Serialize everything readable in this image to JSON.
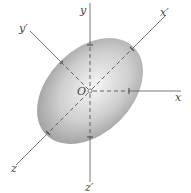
{
  "figure": {
    "origin": {
      "label": "O",
      "x": 90,
      "y": 91
    },
    "ellipsoid": {
      "cx": 90,
      "cy": 91,
      "rx": 42,
      "ry": 62,
      "rotation_deg": 45,
      "fill_center": "#f4f4f4",
      "fill_edge": "#9a9a9a"
    },
    "axes": [
      {
        "name": "y",
        "label": "y",
        "from": [
          90,
          0
        ],
        "to": [
          90,
          91
        ],
        "label_pos": [
          80,
          13
        ]
      },
      {
        "name": "z-prime",
        "label": "z′",
        "from": [
          90,
          91
        ],
        "to": [
          90,
          193
        ],
        "label_pos": [
          85,
          190
        ]
      },
      {
        "name": "x",
        "label": "x",
        "from": [
          90,
          91
        ],
        "to": [
          181,
          91
        ],
        "label_pos": [
          175,
          101
        ]
      },
      {
        "name": "x-prime",
        "label": "x′",
        "from": [
          90,
          91
        ],
        "to": [
          166,
          15
        ],
        "label_pos": [
          162,
          16
        ]
      },
      {
        "name": "z",
        "label": "z",
        "from": [
          90,
          91
        ],
        "to": [
          15,
          166
        ],
        "label_pos": [
          11,
          172
        ]
      },
      {
        "name": "y-prime",
        "label": "y′",
        "from": [
          30,
          31
        ],
        "to": [
          90,
          91
        ],
        "label_pos": [
          19,
          31
        ]
      }
    ],
    "colors": {
      "axis": "#6a6a6a",
      "label": "#444444"
    }
  }
}
